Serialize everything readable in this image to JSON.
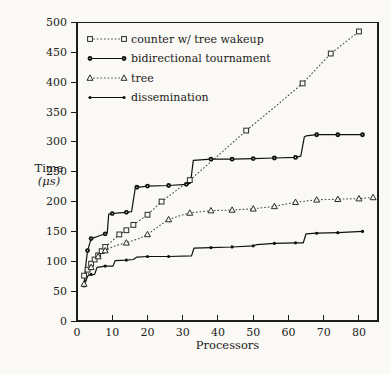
{
  "figure": {
    "background": "#faf9f5",
    "axis_color": "#1c1c1c",
    "dotted_line_color": "#4a4a4a",
    "solid_line_color": "#111111"
  },
  "chart_data": {
    "type": "line",
    "title": "",
    "xlabel": "Processors",
    "ylabel_line1": "Time",
    "ylabel_line2": "(μs)",
    "xlim": [
      0,
      85.4
    ],
    "ylim": [
      0,
      500
    ],
    "x_ticks": [
      0,
      10,
      20,
      30,
      40,
      50,
      60,
      70,
      80
    ],
    "y_ticks": [
      0,
      50,
      100,
      150,
      200,
      250,
      300,
      350,
      400,
      450,
      500
    ],
    "grid": false,
    "legend_position": "top-left-inside",
    "series": [
      {
        "name": "counter w/ tree wakeup",
        "line": "dotted",
        "marker": "open-square",
        "points": [
          [
            2,
            76
          ],
          [
            3,
            86
          ],
          [
            4,
            96
          ],
          [
            5,
            103
          ],
          [
            6,
            110
          ],
          [
            7,
            117
          ],
          [
            8,
            124
          ],
          [
            10,
            134
          ],
          [
            12,
            145
          ],
          [
            14,
            152
          ],
          [
            16,
            161
          ],
          [
            20,
            178
          ],
          [
            24,
            200
          ],
          [
            28,
            218
          ],
          [
            32,
            236
          ],
          [
            40,
            277
          ],
          [
            48,
            319
          ],
          [
            56,
            358
          ],
          [
            64,
            398
          ],
          [
            72,
            448
          ],
          [
            80,
            485
          ]
        ],
        "markers": [
          [
            2,
            76
          ],
          [
            3,
            86
          ],
          [
            4,
            96
          ],
          [
            5,
            103
          ],
          [
            6,
            110
          ],
          [
            7,
            117
          ],
          [
            8,
            124
          ],
          [
            12,
            145
          ],
          [
            14,
            152
          ],
          [
            16,
            161
          ],
          [
            20,
            178
          ],
          [
            24,
            200
          ],
          [
            32,
            236
          ],
          [
            48,
            319
          ],
          [
            64,
            398
          ],
          [
            72,
            448
          ],
          [
            80,
            485
          ]
        ]
      },
      {
        "name": "bidirectional tournament",
        "line": "solid",
        "marker": "filled-circle",
        "points": [
          [
            2,
            60
          ],
          [
            2.6,
            100
          ],
          [
            3,
            118
          ],
          [
            4,
            138
          ],
          [
            6,
            142
          ],
          [
            8,
            146
          ],
          [
            8.6,
            148
          ],
          [
            9,
            179
          ],
          [
            10,
            180
          ],
          [
            12,
            181
          ],
          [
            14,
            182
          ],
          [
            15.5,
            183
          ],
          [
            16.5,
            222
          ],
          [
            17,
            224
          ],
          [
            20,
            226
          ],
          [
            26,
            227
          ],
          [
            31,
            229
          ],
          [
            32.2,
            231
          ],
          [
            33,
            269
          ],
          [
            38,
            271
          ],
          [
            44,
            271
          ],
          [
            50,
            272
          ],
          [
            56,
            273
          ],
          [
            62,
            274
          ],
          [
            63.5,
            276
          ],
          [
            64.5,
            308
          ],
          [
            65,
            310
          ],
          [
            68,
            312
          ],
          [
            74,
            312
          ],
          [
            81,
            312
          ]
        ],
        "markers": [
          [
            2,
            60
          ],
          [
            3,
            118
          ],
          [
            4,
            138
          ],
          [
            8,
            146
          ],
          [
            10,
            180
          ],
          [
            14,
            182
          ],
          [
            17,
            224
          ],
          [
            20,
            226
          ],
          [
            26,
            227
          ],
          [
            31,
            229
          ],
          [
            38,
            271
          ],
          [
            44,
            271
          ],
          [
            50,
            272
          ],
          [
            56,
            273
          ],
          [
            62,
            274
          ],
          [
            68,
            312
          ],
          [
            74,
            312
          ],
          [
            81,
            312
          ]
        ]
      },
      {
        "name": "tree",
        "line": "dotted",
        "marker": "open-triangle",
        "points": [
          [
            2,
            62
          ],
          [
            3,
            76
          ],
          [
            4,
            90
          ],
          [
            5,
            100
          ],
          [
            6,
            108
          ],
          [
            8,
            118
          ],
          [
            10,
            124
          ],
          [
            12,
            128
          ],
          [
            14,
            131
          ],
          [
            16,
            135
          ],
          [
            18,
            139
          ],
          [
            20,
            145
          ],
          [
            23,
            158
          ],
          [
            26,
            170
          ],
          [
            29,
            176
          ],
          [
            32,
            181
          ],
          [
            38,
            185
          ],
          [
            44,
            186
          ],
          [
            50,
            188
          ],
          [
            56,
            192
          ],
          [
            62,
            199
          ],
          [
            68,
            203
          ],
          [
            74,
            204
          ],
          [
            80,
            205
          ],
          [
            84,
            207
          ]
        ],
        "markers": [
          [
            2,
            62
          ],
          [
            4,
            90
          ],
          [
            6,
            108
          ],
          [
            8,
            118
          ],
          [
            14,
            131
          ],
          [
            20,
            145
          ],
          [
            26,
            170
          ],
          [
            32,
            181
          ],
          [
            38,
            185
          ],
          [
            44,
            186
          ],
          [
            50,
            188
          ],
          [
            56,
            192
          ],
          [
            62,
            199
          ],
          [
            68,
            203
          ],
          [
            74,
            204
          ],
          [
            80,
            205
          ],
          [
            84,
            207
          ]
        ]
      },
      {
        "name": "dissemination",
        "line": "solid",
        "marker": "small-dot",
        "points": [
          [
            2,
            58
          ],
          [
            3,
            75
          ],
          [
            3.5,
            77
          ],
          [
            5,
            78
          ],
          [
            5.7,
            90
          ],
          [
            8,
            92
          ],
          [
            10.2,
            92
          ],
          [
            10.8,
            101
          ],
          [
            14,
            102
          ],
          [
            16,
            103
          ],
          [
            17,
            107
          ],
          [
            20,
            108
          ],
          [
            26,
            108
          ],
          [
            32.5,
            109
          ],
          [
            33.2,
            122
          ],
          [
            38,
            123
          ],
          [
            44,
            124
          ],
          [
            50,
            126
          ],
          [
            51,
            128
          ],
          [
            56,
            130
          ],
          [
            62,
            131
          ],
          [
            64.2,
            131
          ],
          [
            65,
            146
          ],
          [
            68,
            147
          ],
          [
            74,
            148
          ],
          [
            81,
            150
          ]
        ],
        "markers": [
          [
            4,
            78
          ],
          [
            8,
            92
          ],
          [
            14,
            102
          ],
          [
            20,
            108
          ],
          [
            26,
            108
          ],
          [
            38,
            123
          ],
          [
            44,
            124
          ],
          [
            50,
            126
          ],
          [
            56,
            130
          ],
          [
            62,
            131
          ],
          [
            68,
            147
          ],
          [
            74,
            148
          ],
          [
            81,
            150
          ]
        ]
      }
    ]
  }
}
